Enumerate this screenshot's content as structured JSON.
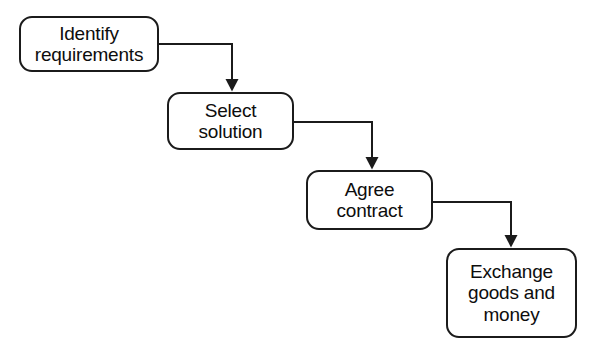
{
  "diagram": {
    "type": "flowchart",
    "orientation": "cascading-down-right",
    "background_color": "#ffffff",
    "stroke_color": "#1b1b1b",
    "text_color": "#0d0d0d",
    "nodes": [
      {
        "id": "identify-requirements",
        "label": "Identify\nrequirements",
        "shape": "rounded-rectangle",
        "x": 19,
        "y": 16,
        "width": 140,
        "height": 56
      },
      {
        "id": "select-solution",
        "label": "Select\nsolution",
        "shape": "rounded-rectangle",
        "x": 167,
        "y": 92,
        "width": 127,
        "height": 58
      },
      {
        "id": "agree-contract",
        "label": "Agree\ncontract",
        "shape": "rounded-rectangle",
        "x": 306,
        "y": 170,
        "width": 127,
        "height": 60
      },
      {
        "id": "exchange-goods-and-money",
        "label": "Exchange\ngoods and\nmoney",
        "shape": "rounded-rectangle",
        "x": 446,
        "y": 248,
        "width": 131,
        "height": 90
      }
    ],
    "connectors": [
      {
        "id": "connector-1",
        "from": "identify-requirements",
        "to": "select-solution",
        "style": "elbow-right-then-down",
        "arrowhead": "solid-triangle",
        "path": "M 159 44 L 232 44 L 232 90"
      },
      {
        "id": "connector-2",
        "from": "select-solution",
        "to": "agree-contract",
        "style": "elbow-right-then-down",
        "arrowhead": "solid-triangle",
        "path": "M 294 122 L 372 122 L 372 168"
      },
      {
        "id": "connector-3",
        "from": "agree-contract",
        "to": "exchange-goods-and-money",
        "style": "elbow-right-then-down",
        "arrowhead": "solid-triangle",
        "path": "M 433 202 L 511 202 L 511 246"
      }
    ]
  }
}
